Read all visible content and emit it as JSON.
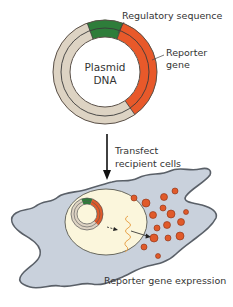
{
  "figure": {
    "plasmid": {
      "center_label_line1": "Plasmid",
      "center_label_line2": "DNA",
      "segments": [
        {
          "name": "Regulatory sequence",
          "color": "#2e7d3a"
        },
        {
          "name": "Reporter gene",
          "color": "#e8592a"
        },
        {
          "name": "backbone",
          "color": "#ddd3c3"
        }
      ]
    },
    "labels": {
      "regulatory": "Regulatory sequence",
      "reporter_line1": "Reporter",
      "reporter_line2": "gene",
      "transfect_line1": "Transfect",
      "transfect_line2": "recipient cells",
      "expression": "Reporter gene expression"
    },
    "colors": {
      "cell_fill": "#c9d1dc",
      "cell_outline": "#5a6068",
      "nucleus_fill": "#fbf6dc",
      "protein": "#e05a2a",
      "mrna": "#e8a24a",
      "outline": "#333333"
    }
  }
}
